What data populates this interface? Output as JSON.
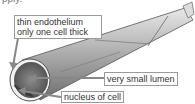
{
  "cut_text": "pply.",
  "labels": {
    "endothelium_line1": "thin endothelium",
    "endothelium_line2": "only one cell thick",
    "lumen": "very small lumen",
    "nucleus": "nucleus of cell"
  }
}
